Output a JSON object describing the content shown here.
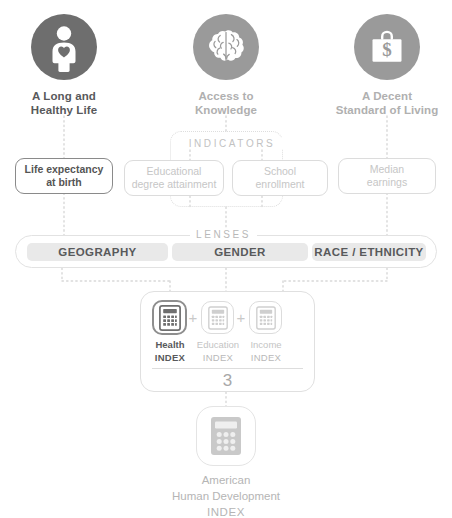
{
  "diagram": {
    "colors": {
      "dark_circle": "#6e6e6e",
      "mid_circle": "#9a9a9a",
      "light_gray": "#c6c6c6",
      "pill_bg": "#e9e9e9",
      "text_dark": "#58595b",
      "text_faint": "#c4c4c4",
      "border_faint": "#dcdcdc",
      "white": "#ffffff"
    }
  },
  "pillars": [
    {
      "id": "health",
      "icon": "person-with-heart-icon",
      "label_line1": "A Long and",
      "label_line2": "Healthy Life",
      "emphasis": "strong",
      "circle_color": "#6e6e6e",
      "text_color": "#58595b"
    },
    {
      "id": "education",
      "icon": "brain-icon",
      "label_line1": "Access to",
      "label_line2": "Knowledge",
      "emphasis": "faint",
      "circle_color": "#9a9a9a",
      "text_color": "#b0b0b0"
    },
    {
      "id": "income",
      "icon": "briefcase-dollar-icon",
      "label_line1": "A Decent",
      "label_line2": "Standard of Living",
      "emphasis": "faint",
      "circle_color": "#9a9a9a",
      "text_color": "#b0b0b0"
    }
  ],
  "indicators": {
    "caption": "INDICATORS",
    "boxes": [
      {
        "id": "life-expectancy",
        "line1": "Life expectancy",
        "line2": "at birth",
        "emphasis": "strong"
      },
      {
        "id": "educational-degree-attainment",
        "line1": "Educational",
        "line2": "degree attainment",
        "emphasis": "faint"
      },
      {
        "id": "school-enrollment",
        "line1": "School",
        "line2": "enrollment",
        "emphasis": "faint"
      },
      {
        "id": "median-earnings",
        "line1": "Median",
        "line2": "earnings",
        "emphasis": "faint"
      }
    ]
  },
  "lenses": {
    "caption": "LENSES",
    "items": [
      {
        "id": "geography",
        "label": "GEOGRAPHY"
      },
      {
        "id": "gender",
        "label": "GENDER"
      },
      {
        "id": "race-ethnicity",
        "label": "RACE / ETHNICITY"
      }
    ]
  },
  "index_composite": {
    "components": [
      {
        "id": "health-index",
        "icon": "calculator-icon",
        "name": "Health",
        "word": "INDEX",
        "emphasis": "strong"
      },
      {
        "id": "education-index",
        "icon": "calculator-icon",
        "name": "Education",
        "word": "INDEX",
        "emphasis": "faint"
      },
      {
        "id": "income-index",
        "icon": "calculator-icon",
        "name": "Income",
        "word": "INDEX",
        "emphasis": "faint"
      }
    ],
    "operator": "+",
    "denominator": "3"
  },
  "result": {
    "icon": "calculator-icon",
    "line1": "American",
    "line2": "Human Development",
    "line3": "INDEX"
  }
}
